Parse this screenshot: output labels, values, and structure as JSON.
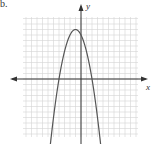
{
  "figure": {
    "label": "b.",
    "y_axis_label": "y",
    "x_axis_label": "x"
  },
  "colors": {
    "grid": "#d4d4d4",
    "axis": "#333333",
    "curve": "#555555",
    "background": "#ffffff"
  },
  "chart_data": {
    "type": "line",
    "title": "",
    "xlabel": "x",
    "ylabel": "y",
    "grid": true,
    "xlim": [
      -10,
      10
    ],
    "ylim": [
      -10,
      11
    ],
    "vertex": [
      -1,
      9
    ],
    "x_intercepts": [
      -4,
      2
    ],
    "series": [
      {
        "name": "parabola",
        "x": [
          -6,
          -5,
          -4,
          -3,
          -2,
          -1,
          0,
          1,
          2,
          3,
          4
        ],
        "y": [
          -16,
          -7,
          0,
          5,
          8,
          9,
          8,
          5,
          0,
          -7,
          -16
        ]
      }
    ]
  }
}
